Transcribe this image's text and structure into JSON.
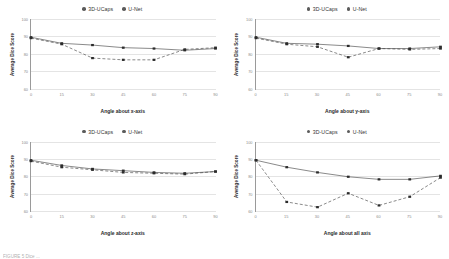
{
  "legend": {
    "items": [
      {
        "label": "3D-UCaps",
        "marker": "circle-marker",
        "style": "solid"
      },
      {
        "label": "U-Net",
        "marker": "circle-marker",
        "style": "dashed"
      }
    ]
  },
  "axis": {
    "ylabel": "Average Dice Score",
    "yticks": [
      "100",
      "90",
      "80",
      "70",
      "60"
    ]
  },
  "caption": {
    "text": "FIGURE 5  Dice ..."
  },
  "colors": {
    "line": "#3a3a3a",
    "marker": "#2b2b2b",
    "grid": "#e4e4e4",
    "axis": "#9a9a9a",
    "tick_text": "#8a8a8a"
  },
  "chart_data": [
    {
      "type": "line",
      "id": "angle-about-x-axis",
      "title": "",
      "xlabel": "Angle about x-axis",
      "ylabel": "Average Dice Score",
      "x": [
        0,
        15,
        30,
        45,
        60,
        75,
        90
      ],
      "xticks": [
        "0",
        "15",
        "30",
        "45",
        "60",
        "75",
        "90"
      ],
      "xlim": [
        0,
        90
      ],
      "ylim": [
        60,
        100
      ],
      "yticks": [
        60,
        70,
        80,
        90,
        100
      ],
      "grid": true,
      "legend_position": "top-center",
      "series": [
        {
          "name": "3D-UCaps",
          "style": "solid",
          "values": [
            89.5,
            86.0,
            85.0,
            83.5,
            83.0,
            82.0,
            83.0
          ]
        },
        {
          "name": "U-Net",
          "style": "dashed",
          "values": [
            89.0,
            85.5,
            77.5,
            76.5,
            76.5,
            82.5,
            83.5
          ]
        }
      ]
    },
    {
      "type": "line",
      "id": "angle-about-y-axis",
      "title": "",
      "xlabel": "Angle about y-axis",
      "ylabel": "Average Dice Score",
      "x": [
        0,
        15,
        30,
        45,
        60,
        75,
        90
      ],
      "xticks": [
        "0",
        "15",
        "30",
        "45",
        "60",
        "75",
        "90"
      ],
      "xlim": [
        0,
        90
      ],
      "ylim": [
        60,
        100
      ],
      "yticks": [
        60,
        70,
        80,
        90,
        100
      ],
      "grid": true,
      "legend_position": "top-center",
      "series": [
        {
          "name": "3D-UCaps",
          "style": "solid",
          "values": [
            89.5,
            86.0,
            85.5,
            84.5,
            83.0,
            83.0,
            84.0
          ]
        },
        {
          "name": "U-Net",
          "style": "dashed",
          "values": [
            89.0,
            85.5,
            84.0,
            78.0,
            83.0,
            82.5,
            83.0
          ]
        }
      ]
    },
    {
      "type": "line",
      "id": "angle-about-z-axis",
      "title": "",
      "xlabel": "Angle about z-axis",
      "ylabel": "Average Dice Score",
      "x": [
        0,
        15,
        30,
        45,
        60,
        75,
        90
      ],
      "xticks": [
        "0",
        "15",
        "30",
        "45",
        "60",
        "75",
        "90"
      ],
      "xlim": [
        0,
        90
      ],
      "ylim": [
        60,
        100
      ],
      "yticks": [
        60,
        70,
        80,
        90,
        100
      ],
      "grid": true,
      "legend_position": "top-center",
      "series": [
        {
          "name": "3D-UCaps",
          "style": "solid",
          "values": [
            89.5,
            86.5,
            84.5,
            83.5,
            82.5,
            82.0,
            83.0
          ]
        },
        {
          "name": "U-Net",
          "style": "dashed",
          "values": [
            89.0,
            85.5,
            84.0,
            82.5,
            82.0,
            81.5,
            83.0
          ]
        }
      ]
    },
    {
      "type": "line",
      "id": "angle-about-all-axis",
      "title": "",
      "xlabel": "Angle about all axis",
      "ylabel": "Average Dice Score",
      "x": [
        0,
        15,
        30,
        45,
        60,
        75,
        90
      ],
      "xticks": [
        "0",
        "15",
        "30",
        "45",
        "60",
        "75",
        "90"
      ],
      "xlim": [
        0,
        90
      ],
      "ylim": [
        60,
        100
      ],
      "yticks": [
        60,
        70,
        80,
        90,
        100
      ],
      "grid": true,
      "legend_position": "top-center",
      "series": [
        {
          "name": "3D-UCaps",
          "style": "solid",
          "values": [
            89.5,
            85.5,
            82.5,
            80.0,
            78.5,
            78.5,
            80.5
          ]
        },
        {
          "name": "U-Net",
          "style": "dashed",
          "values": [
            89.5,
            65.5,
            62.5,
            70.5,
            63.5,
            68.5,
            79.5
          ]
        }
      ]
    }
  ]
}
